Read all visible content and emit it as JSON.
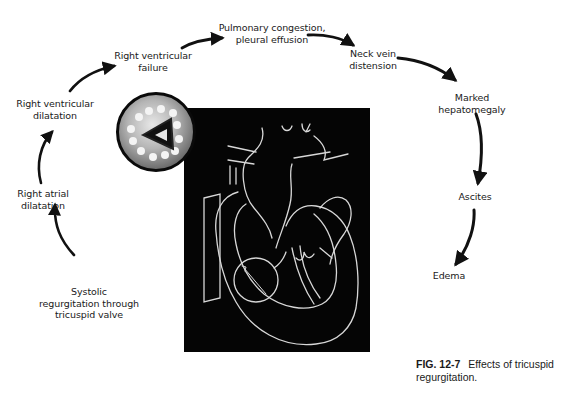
{
  "diagram": {
    "type": "cyclic flow diagram with central anatomical illustration",
    "central_image": "Cross-section of heart showing tricuspid valve regurgitation (light lines on black background) with circular inset of tricuspid valve",
    "steps": [
      {
        "id": "s1",
        "lines": [
          "Systolic",
          "regurgitation through",
          "tricuspid valve"
        ]
      },
      {
        "id": "s2",
        "lines": [
          "Right atrial",
          "dilatation"
        ]
      },
      {
        "id": "s3",
        "lines": [
          "Right ventricular",
          "dilatation"
        ]
      },
      {
        "id": "s4",
        "lines": [
          "Right ventricular",
          "failure"
        ]
      },
      {
        "id": "s5",
        "lines": [
          "Pulmonary congestion,",
          "pleural effusion"
        ]
      },
      {
        "id": "s6",
        "lines": [
          "Neck vein",
          "distension"
        ]
      },
      {
        "id": "s7",
        "lines": [
          "Marked",
          "hepatomegaly"
        ]
      },
      {
        "id": "s8",
        "lines": [
          "Ascites"
        ]
      },
      {
        "id": "s9",
        "lines": [
          "Edema"
        ]
      }
    ],
    "edges": [
      [
        "s1",
        "s2"
      ],
      [
        "s2",
        "s3"
      ],
      [
        "s3",
        "s4"
      ],
      [
        "s4",
        "s5"
      ],
      [
        "s5",
        "s6"
      ],
      [
        "s6",
        "s7"
      ],
      [
        "s7",
        "s8"
      ],
      [
        "s8",
        "s9"
      ]
    ]
  },
  "caption": {
    "figure_number": "FIG. 12-7",
    "text_line1": "Effects of tricuspid",
    "text_line2": "regurgitation."
  },
  "colors": {
    "background": "#ffffff",
    "text": "#1a1a1a",
    "arrows": "#111111",
    "illustration_bg": "#050505",
    "illustration_lines": "#d8d8d8"
  }
}
